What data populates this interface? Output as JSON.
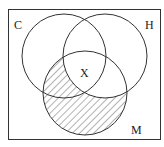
{
  "diagram": {
    "type": "venn",
    "sets": [
      {
        "label": "C",
        "cx": 64,
        "cy": 56,
        "r": 42
      },
      {
        "label": "H",
        "cx": 105,
        "cy": 56,
        "r": 42
      },
      {
        "label": "M",
        "cx": 85,
        "cy": 93,
        "r": 42
      }
    ],
    "center_label": "X",
    "shaded_region": "M minus H",
    "colors": {
      "stroke": "#333333",
      "hatch": "#555555",
      "background": "#ffffff"
    }
  }
}
